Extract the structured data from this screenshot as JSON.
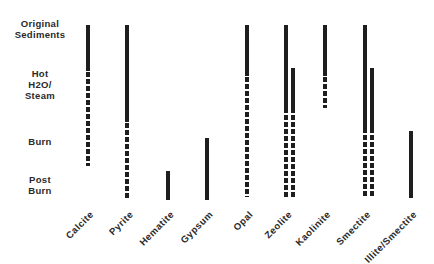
{
  "chart_data": {
    "type": "range-bar-diagram",
    "title": "",
    "stages": [
      "Original Sediments",
      "Hot H2O/ Steam",
      "Burn",
      "Post Burn"
    ],
    "stage_labels": [
      {
        "lines": [
          "Original",
          "Sediments"
        ],
        "y": 18
      },
      {
        "lines": [
          "Hot",
          "H2O/",
          "Steam"
        ],
        "y": 68
      },
      {
        "lines": [
          "Burn"
        ],
        "y": 136
      },
      {
        "lines": [
          "Post",
          "Burn"
        ],
        "y": 174
      }
    ],
    "legend": {
      "solid": "present",
      "dashed": "diminishing / partial"
    },
    "minerals": [
      {
        "name": "Calcite",
        "x": 86,
        "bars": [
          {
            "segments": [
              {
                "style": "solid",
                "y0": 25,
                "y1": 71
              },
              {
                "style": "dashed",
                "y0": 72,
                "y1": 166
              }
            ]
          }
        ]
      },
      {
        "name": "Pyrite",
        "x": 125,
        "bars": [
          {
            "segments": [
              {
                "style": "solid",
                "y0": 25,
                "y1": 122
              },
              {
                "style": "dashed",
                "y0": 123,
                "y1": 199
              }
            ]
          }
        ]
      },
      {
        "name": "Hematite",
        "x": 166,
        "bars": [
          {
            "segments": [
              {
                "style": "solid",
                "y0": 171,
                "y1": 200
              }
            ]
          }
        ]
      },
      {
        "name": "Gypsum",
        "x": 205,
        "bars": [
          {
            "segments": [
              {
                "style": "solid",
                "y0": 138,
                "y1": 200
              }
            ]
          }
        ]
      },
      {
        "name": "Opal",
        "x": 245,
        "bars": [
          {
            "segments": [
              {
                "style": "solid",
                "y0": 25,
                "y1": 76
              },
              {
                "style": "dashed",
                "y0": 77,
                "y1": 197
              }
            ]
          }
        ]
      },
      {
        "name": "Zeolite",
        "x": 284,
        "bars": [
          {
            "segments": [
              {
                "style": "solid",
                "y0": 25,
                "y1": 113
              },
              {
                "style": "dashed",
                "y0": 115,
                "y1": 197
              }
            ]
          },
          {
            "offset": 7,
            "segments": [
              {
                "style": "solid",
                "y0": 68,
                "y1": 113
              },
              {
                "style": "dashed",
                "y0": 115,
                "y1": 197
              }
            ]
          }
        ]
      },
      {
        "name": "Kaolinite",
        "x": 323,
        "bars": [
          {
            "segments": [
              {
                "style": "solid",
                "y0": 25,
                "y1": 76
              },
              {
                "style": "dashed",
                "y0": 77,
                "y1": 108
              }
            ]
          }
        ]
      },
      {
        "name": "Smectite",
        "x": 363,
        "bars": [
          {
            "segments": [
              {
                "style": "solid",
                "y0": 25,
                "y1": 133
              },
              {
                "style": "dashed",
                "y0": 135,
                "y1": 196
              }
            ]
          },
          {
            "offset": 7,
            "segments": [
              {
                "style": "solid",
                "y0": 68,
                "y1": 133
              },
              {
                "style": "dashed",
                "y0": 135,
                "y1": 196
              }
            ]
          }
        ]
      },
      {
        "name": "Illite/Smectite",
        "x": 409,
        "bars": [
          {
            "segments": [
              {
                "style": "solid",
                "y0": 131,
                "y1": 198
              }
            ]
          }
        ]
      }
    ],
    "xlabel": "",
    "ylabel": "",
    "grid": false
  }
}
